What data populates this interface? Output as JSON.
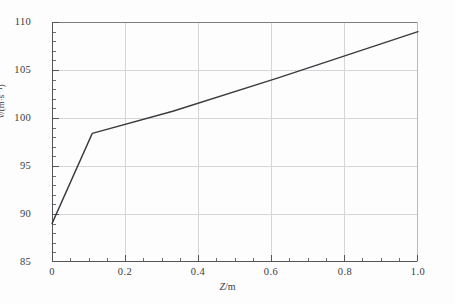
{
  "chart_data": {
    "type": "line",
    "title": "",
    "xlabel": "Z/m",
    "xlabel_var": "Z",
    "xlabel_unit": "/m",
    "ylabel": "v/(m·s⁻¹)",
    "ylabel_var": "v",
    "ylabel_unit": "/(m·s⁻¹)",
    "xlim": [
      0,
      1.0
    ],
    "ylim": [
      85,
      110
    ],
    "x_major_ticks": [
      0,
      0.2,
      0.4,
      0.6,
      0.8,
      1.0
    ],
    "x_tick_labels": [
      "0",
      "0.2",
      "0.4",
      "0.6",
      "0.8",
      "1.0"
    ],
    "x_minor_step": 0.05,
    "y_major_ticks": [
      85,
      90,
      95,
      100,
      105,
      110
    ],
    "y_tick_labels": [
      "85",
      "90",
      "95",
      "100",
      "105",
      "110"
    ],
    "y_minor_step": 1,
    "grid": true,
    "grid_color": "#d6d6d8",
    "legend": null,
    "line_color": "#3a3b3e",
    "line_width": 1.4,
    "series": [
      {
        "name": "v",
        "x": [
          0.0,
          0.11,
          0.33,
          0.62,
          1.0
        ],
        "values": [
          89.0,
          98.4,
          100.7,
          104.2,
          109.0
        ]
      }
    ]
  }
}
